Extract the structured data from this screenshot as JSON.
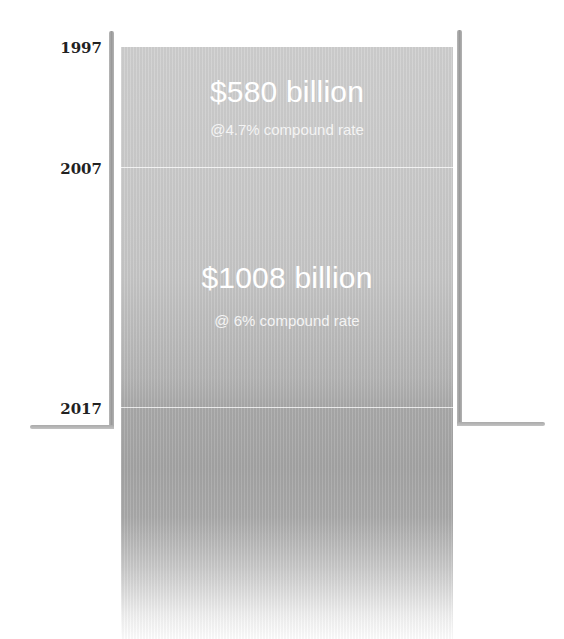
{
  "title": {
    "text_partial": "… y p …",
    "note": "title cropped at top edge; only descenders visible"
  },
  "timeline": {
    "years": [
      {
        "label": "1997"
      },
      {
        "label": "2007"
      },
      {
        "label": "2017"
      }
    ]
  },
  "segments": [
    {
      "period": "1997–2007",
      "amount": "$580 billion",
      "rate": "@4.7% compound rate"
    },
    {
      "period": "2007–2017",
      "amount": "$1008 billion",
      "rate": "@ 6% compound rate"
    }
  ],
  "colors": {
    "column_top": "#cfcfcf",
    "column_mid": "#a4a4a4",
    "wall": "#a8a8a8",
    "text_on_column": "#ffffff",
    "year_text": "#222222"
  }
}
